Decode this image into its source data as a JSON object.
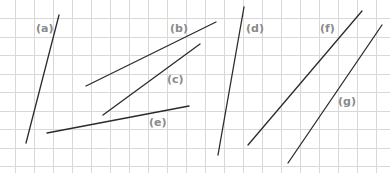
{
  "diagram": {
    "grid": {
      "color": "#d8d8d8",
      "x_lines": [
        15,
        34,
        53,
        72,
        91,
        110,
        129,
        148,
        167,
        186,
        205,
        224,
        243,
        262,
        281,
        300,
        319,
        338,
        357,
        376
      ],
      "y_lines": [
        18,
        37,
        55,
        74,
        92,
        111,
        129,
        148,
        166
      ]
    },
    "line_color": "#2b2b2b",
    "label_color": "#8a8a8a",
    "segments": [
      {
        "id": "a",
        "label": "(a)",
        "x1": 59,
        "y1": 15,
        "x2": 26,
        "y2": 143,
        "label_x": 36,
        "label_y": 23
      },
      {
        "id": "b",
        "label": "(b)",
        "x1": 86,
        "y1": 86,
        "x2": 216,
        "y2": 22,
        "label_x": 170,
        "label_y": 23
      },
      {
        "id": "c",
        "label": "(c)",
        "x1": 103,
        "y1": 115,
        "x2": 200,
        "y2": 44,
        "label_x": 167,
        "label_y": 74
      },
      {
        "id": "d",
        "label": "(d)",
        "x1": 244,
        "y1": 7,
        "x2": 218,
        "y2": 155,
        "label_x": 246,
        "label_y": 23
      },
      {
        "id": "e",
        "label": "(e)",
        "x1": 47,
        "y1": 133,
        "x2": 189,
        "y2": 106,
        "label_x": 149,
        "label_y": 117
      },
      {
        "id": "f",
        "label": "(f)",
        "x1": 362,
        "y1": 11,
        "x2": 248,
        "y2": 145,
        "label_x": 320,
        "label_y": 23
      },
      {
        "id": "g",
        "label": "(g)",
        "x1": 382,
        "y1": 25,
        "x2": 288,
        "y2": 163,
        "label_x": 338,
        "label_y": 96
      }
    ]
  }
}
